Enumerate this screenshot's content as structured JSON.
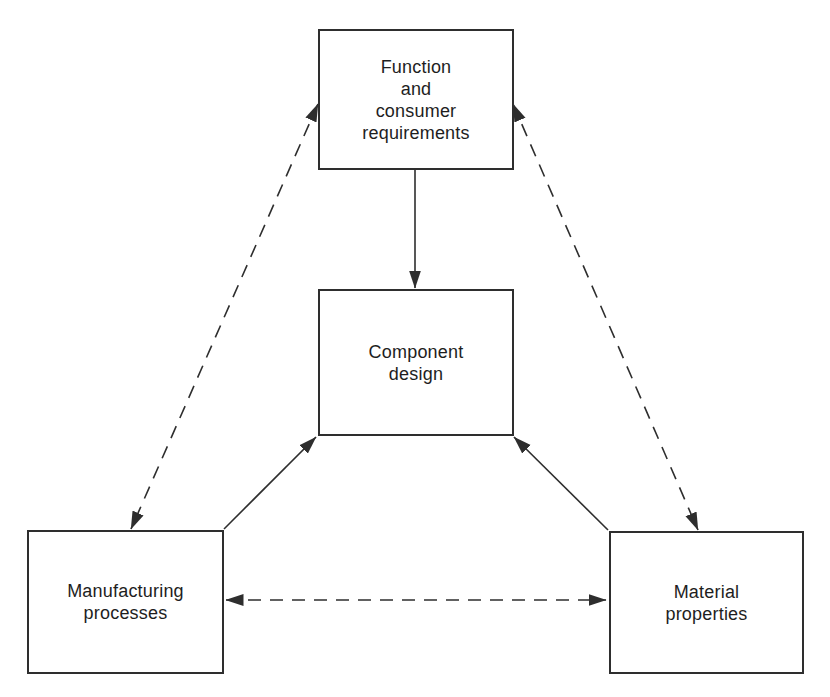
{
  "diagram": {
    "background_color": "#ffffff",
    "line_color": "#2e2e2e",
    "text_color": "#1e1e1e",
    "nodes": {
      "function_requirements": {
        "label": "Function\nand\nconsumer\nrequirements"
      },
      "component_design": {
        "label": "Component\ndesign"
      },
      "manufacturing_processes": {
        "label": "Manufacturing\nprocesses"
      },
      "material_properties": {
        "label": "Material\nproperties"
      }
    },
    "edges": [
      {
        "from": "function_requirements",
        "to": "component_design",
        "style": "solid",
        "direction": "one-way"
      },
      {
        "from": "manufacturing_processes",
        "to": "component_design",
        "style": "solid",
        "direction": "one-way"
      },
      {
        "from": "material_properties",
        "to": "component_design",
        "style": "solid",
        "direction": "one-way"
      },
      {
        "from": "function_requirements",
        "to": "manufacturing_processes",
        "style": "dashed",
        "direction": "two-way"
      },
      {
        "from": "function_requirements",
        "to": "material_properties",
        "style": "dashed",
        "direction": "two-way"
      },
      {
        "from": "manufacturing_processes",
        "to": "material_properties",
        "style": "dashed",
        "direction": "two-way"
      }
    ]
  }
}
